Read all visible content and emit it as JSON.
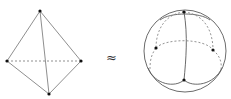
{
  "figure": {
    "relation_symbol": "≈",
    "left": {
      "name": "tetrahedron",
      "vertices": [
        [
          40,
          11
        ],
        [
          7,
          61
        ],
        [
          81,
          61
        ],
        [
          49,
          94
        ]
      ],
      "edge_color": "#8a8a8a",
      "hidden_edge_style": "dashed"
    },
    "right": {
      "name": "sphere-partition",
      "circle": {
        "cx": 185,
        "cy": 51,
        "r": 41
      },
      "points": [
        [
          184,
          12
        ],
        [
          156,
          48
        ],
        [
          213,
          50
        ],
        [
          184,
          80
        ]
      ],
      "line_color": "#555555"
    }
  }
}
